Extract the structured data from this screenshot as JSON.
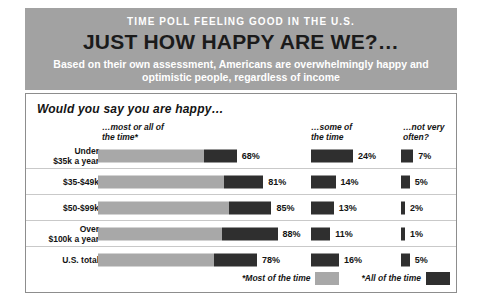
{
  "header": {
    "kicker": "TIME POLL FEELING GOOD IN THE U.S.",
    "headline": "JUST HOW HAPPY ARE WE?…",
    "subhead": "Based on their own assessment, Americans are overwhelmingly happy and optimistic people, regardless of income",
    "background_color": "#a2a2a2",
    "kicker_color": "#ffffff",
    "headline_color": "#1b1b1b"
  },
  "panel": {
    "question": "Would you say you are happy…",
    "border_color": "#8d8d8d"
  },
  "legend": {
    "items": [
      {
        "label": "*Most of the time",
        "color": "#a8a8a8"
      },
      {
        "label": "*All of the time",
        "color": "#2f2f2f"
      }
    ]
  },
  "chart_data": {
    "type": "bar",
    "title": "JUST HOW HAPPY ARE WE?…",
    "subtitle": "Based on their own assessment, Americans are overwhelmingly happy and optimistic people, regardless of income",
    "xlabel": "",
    "ylabel": "",
    "grid": false,
    "legend_position": "bottom-right",
    "categories": [
      "Under\n$35k a year",
      "$35-$49k",
      "$50-$99k",
      "Over\n$100k a year",
      "U.S. total"
    ],
    "column_headers": [
      "…most or all of\nthe time*",
      "…some of\nthe time",
      "…not very\noften?"
    ],
    "series": [
      {
        "name": "…most or all of the time*",
        "values": [
          68,
          81,
          85,
          88,
          78
        ],
        "labels": [
          "68%",
          "81%",
          "85%",
          "88%",
          "78%"
        ],
        "stacked_parts": [
          {
            "name": "*Most of the time",
            "color": "#a8a8a8",
            "values": [
              52,
              62,
              64,
              61,
              57
            ]
          },
          {
            "name": "*All of the time",
            "color": "#2f2f2f",
            "values": [
              16,
              19,
              21,
              27,
              21
            ]
          }
        ]
      },
      {
        "name": "…some of the time",
        "values": [
          24,
          14,
          13,
          11,
          16
        ],
        "labels": [
          "24%",
          "14%",
          "13%",
          "11%",
          "16%"
        ],
        "color": "#2f2f2f"
      },
      {
        "name": "…not very often?",
        "values": [
          7,
          5,
          2,
          1,
          5
        ],
        "labels": [
          "7%",
          "5%",
          "2%",
          "1%",
          "5%"
        ],
        "color": "#2f2f2f"
      }
    ]
  }
}
